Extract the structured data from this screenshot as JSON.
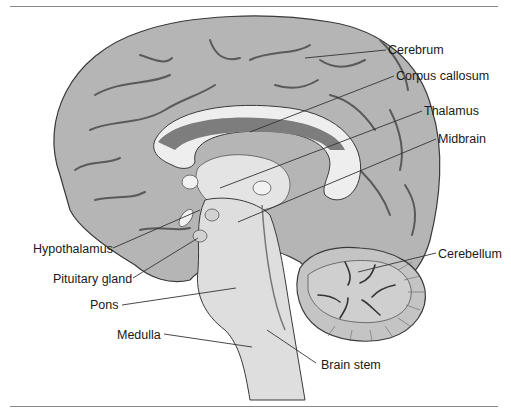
{
  "colors": {
    "cortex": "#b5b5b5",
    "cortex_dark": "#8e8e8e",
    "sulcus": "#555555",
    "white_matter": "#eeeeee",
    "ventricle": "#7d7d7d",
    "brainstem": "#dedede",
    "cerebellum": "#c4c4c4",
    "outline": "#3a3a3a",
    "leader_line": "#333333",
    "text": "#1a1a1a"
  },
  "labels": [
    {
      "id": "cerebrum",
      "text": "Cerebrum",
      "x": 388,
      "y": 49
    },
    {
      "id": "corpus-callosum",
      "text": "Corpus callosum",
      "x": 396,
      "y": 75
    },
    {
      "id": "thalamus",
      "text": "Thalamus",
      "x": 424,
      "y": 110
    },
    {
      "id": "midbrain",
      "text": "Midbrain",
      "x": 438,
      "y": 138
    },
    {
      "id": "hypothalamus",
      "text": "Hypothalamus",
      "x": 33,
      "y": 242
    },
    {
      "id": "pituitary-gland",
      "text": "Pituitary gland",
      "x": 53,
      "y": 272
    },
    {
      "id": "cerebellum",
      "text": "Cerebellum",
      "x": 438,
      "y": 247
    },
    {
      "id": "pons",
      "text": "Pons",
      "x": 90,
      "y": 298
    },
    {
      "id": "medulla",
      "text": "Medulla",
      "x": 117,
      "y": 328
    },
    {
      "id": "brain-stem",
      "text": "Brain stem",
      "x": 321,
      "y": 358
    }
  ]
}
